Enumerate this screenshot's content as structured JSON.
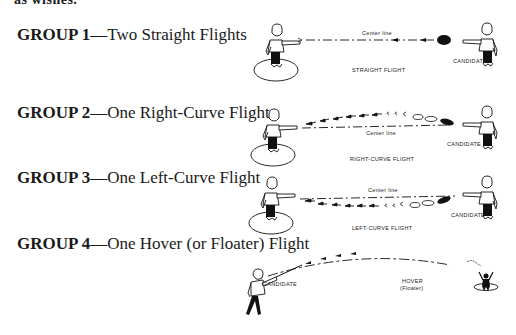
{
  "page": {
    "cut_off_text": "as wishes."
  },
  "groups": [
    {
      "label": "GROUP 1",
      "separator": "—",
      "description": "Two Straight Flights",
      "figure": {
        "caption": "STRAIGHT FLIGHT",
        "center_line": "Center line",
        "thrower": "CANDIDATE"
      }
    },
    {
      "label": "GROUP 2",
      "separator": "—",
      "description": "One Right-Curve Flight",
      "figure": {
        "caption": "RIGHT-CURVE FLIGHT",
        "center_line": "Center line",
        "thrower": "CANDIDATE"
      }
    },
    {
      "label": "GROUP 3",
      "separator": "—",
      "description": "One Left-Curve Flight",
      "figure": {
        "caption": "LEFT-CURVE FLIGHT",
        "center_line": "Center line",
        "thrower": "CANDIDATE"
      }
    },
    {
      "label": "GROUP 4",
      "separator": "—",
      "description": "One Hover (or Floater) Flight",
      "figure": {
        "caption_line1": "HOVER",
        "caption_line2": "(Floater)",
        "thrower": "CANDIDATE"
      }
    }
  ]
}
